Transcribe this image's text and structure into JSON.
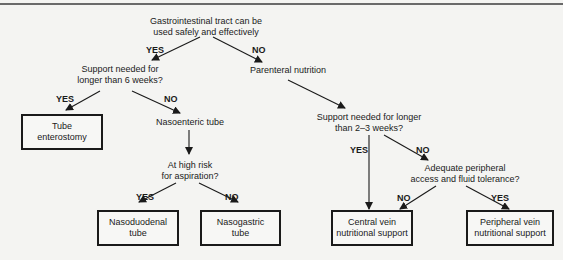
{
  "diagram": {
    "type": "flowchart",
    "nodes": {
      "root": {
        "line1": "Gastrointestinal tract can be",
        "line2": "used safely and effectively"
      },
      "support6": {
        "line1": "Support needed for",
        "line2": "longer than 6 weeks?"
      },
      "parenteral": {
        "line1": "Parenteral nutrition"
      },
      "tube_ent": {
        "line1": "Tube",
        "line2": "enterostomy"
      },
      "nasoenteric": {
        "line1": "Nasoenteric tube"
      },
      "support23": {
        "line1": "Support needed for longer",
        "line2": "than 2–3 weeks?"
      },
      "aspiration": {
        "line1": "At high risk",
        "line2": "for aspiration?"
      },
      "peripheral_q": {
        "line1": "Adequate peripheral",
        "line2": "access and fluid tolerance?"
      },
      "nasoduodenal": {
        "line1": "Nasoduodenal",
        "line2": "tube"
      },
      "nasogastric": {
        "line1": "Nasogastric",
        "line2": "tube"
      },
      "central": {
        "line1": "Central vein",
        "line2": "nutritional support"
      },
      "peripheral": {
        "line1": "Peripheral vein",
        "line2": "nutritional support"
      }
    },
    "edge_labels": {
      "root_yes": "YES",
      "root_no": "NO",
      "s6_yes": "YES",
      "s6_no": "NO",
      "asp_yes": "YES",
      "asp_no": "NO",
      "s23_yes": "YES",
      "s23_no": "NO",
      "pq_no": "NO",
      "pq_yes": "YES"
    },
    "edges": [
      [
        "root",
        "support6",
        "YES"
      ],
      [
        "root",
        "parenteral",
        "NO"
      ],
      [
        "support6",
        "tube_ent",
        "YES"
      ],
      [
        "support6",
        "nasoenteric",
        "NO"
      ],
      [
        "nasoenteric",
        "aspiration",
        ""
      ],
      [
        "aspiration",
        "nasoduodenal",
        "YES"
      ],
      [
        "aspiration",
        "nasogastric",
        "NO"
      ],
      [
        "parenteral",
        "support23",
        ""
      ],
      [
        "support23",
        "central",
        "YES"
      ],
      [
        "support23",
        "peripheral_q",
        "NO"
      ],
      [
        "peripheral_q",
        "central",
        "NO"
      ],
      [
        "peripheral_q",
        "peripheral",
        "YES"
      ]
    ]
  }
}
